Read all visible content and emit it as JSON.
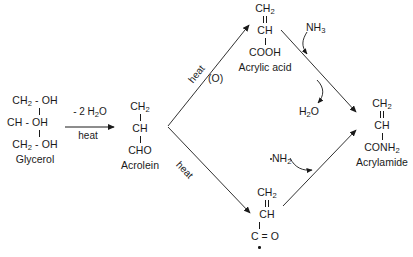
{
  "diagram": {
    "background_color": "#ffffff",
    "ink_color": "#1a1a1a"
  },
  "species": {
    "glycerol": {
      "name": "Glycerol",
      "line1": "CH2 - OH",
      "line1_head": "CH",
      "line1_sub": "2",
      "line1_tail": " - OH",
      "line2": "CH - OH",
      "line3_head": "CH",
      "line3_sub": "2",
      "line3_tail": " - OH"
    },
    "acrolein": {
      "name": "Acrolein",
      "top_head": "CH",
      "top_sub": "2",
      "mid": "CH",
      "bottom": "CHO"
    },
    "acrylic_acid": {
      "name": "Acrylic acid",
      "top_head": "CH",
      "top_sub": "2",
      "mid": "CH",
      "bottom": "COOH"
    },
    "acyl_radical": {
      "name": "",
      "top_head": "CH",
      "top_sub": "2",
      "mid": "CH",
      "bottom": "C = O"
    },
    "acrylamide": {
      "name": "Acrylamide",
      "top_head": "CH",
      "top_sub": "2",
      "mid": "CH",
      "bottom_head": "CONH",
      "bottom_sub": "2"
    }
  },
  "reagents": {
    "dehydration_above": "- 2 H2O",
    "dehydration_above_head": "- 2 H",
    "dehydration_above_sub": "2",
    "dehydration_above_tail": "O",
    "dehydration_below": "heat",
    "upper_path_heat": "heat",
    "upper_path_oxidant": "(O)",
    "lower_path_heat": "heat",
    "ammonia_head": "NH",
    "ammonia_sub": "3",
    "water_head": "H",
    "water_sub": "2",
    "water_tail": "O",
    "amino_radical_head": "NH",
    "amino_radical_sub": "2"
  }
}
